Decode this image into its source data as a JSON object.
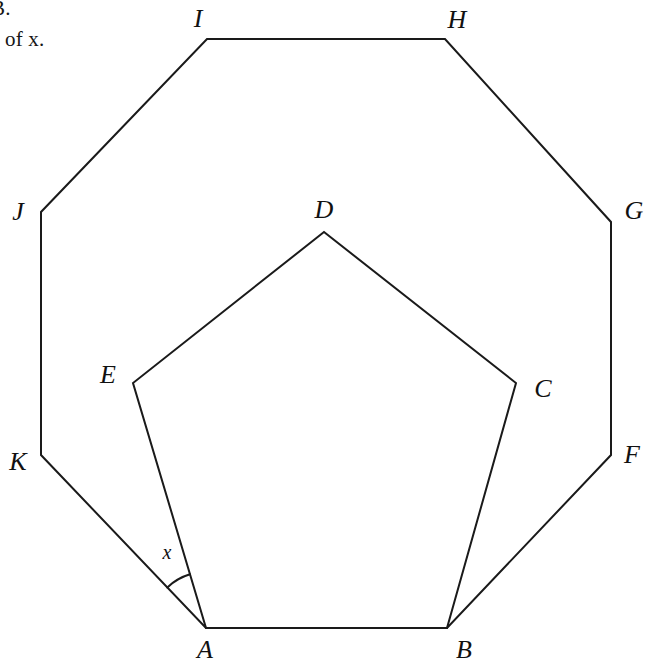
{
  "page": {
    "background_color": "#ffffff",
    "stroke_color": "#1a1a1a",
    "width": 650,
    "height": 667
  },
  "prompt": {
    "line_1": "B.",
    "line_2": "e of x."
  },
  "figure": {
    "outer_shape_name": "regular-octagon",
    "inner_shape_name": "regular-pentagon",
    "outer_vertices": [
      {
        "label": "A",
        "x": 206,
        "y": 628,
        "label_x": 205,
        "label_y": 650
      },
      {
        "label": "B",
        "x": 447,
        "y": 628,
        "label_x": 464,
        "label_y": 650
      },
      {
        "label": "F",
        "x": 611,
        "y": 455,
        "label_x": 632,
        "label_y": 455
      },
      {
        "label": "G",
        "x": 611,
        "y": 222,
        "label_x": 634,
        "label_y": 211
      },
      {
        "label": "H",
        "x": 445,
        "y": 39,
        "label_x": 457,
        "label_y": 20
      },
      {
        "label": "I",
        "x": 207,
        "y": 39,
        "label_x": 198,
        "label_y": 19
      },
      {
        "label": "J",
        "x": 41,
        "y": 212,
        "label_x": 18,
        "label_y": 212
      },
      {
        "label": "K",
        "x": 41,
        "y": 455,
        "label_x": 18,
        "label_y": 462
      }
    ],
    "inner_vertices": [
      {
        "label": "A",
        "x": 206,
        "y": 628,
        "label_x": 205,
        "label_y": 650
      },
      {
        "label": "B",
        "x": 447,
        "y": 628,
        "label_x": 464,
        "label_y": 650
      },
      {
        "label": "C",
        "x": 516,
        "y": 383,
        "label_x": 543,
        "label_y": 389
      },
      {
        "label": "D",
        "x": 324,
        "y": 232,
        "label_x": 324,
        "label_y": 210
      },
      {
        "label": "E",
        "x": 133,
        "y": 383,
        "label_x": 108,
        "label_y": 375
      }
    ],
    "angle_marker": {
      "label": "x",
      "at_vertex": "A",
      "from_vertex": "K",
      "to_vertex": "E",
      "radius": 56,
      "label_x": 167,
      "label_y": 552
    }
  }
}
